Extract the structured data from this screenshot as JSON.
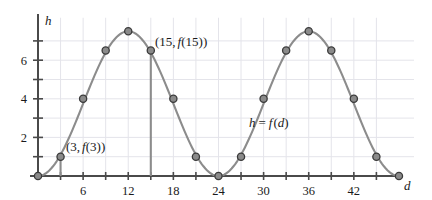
{
  "chart_data": {
    "type": "line",
    "title": "",
    "xlabel": "d",
    "ylabel": "h",
    "grid": true,
    "legend": "none",
    "xlim": [
      0,
      50
    ],
    "ylim": [
      0,
      8.2
    ],
    "x": [
      0,
      3,
      6,
      9,
      12,
      15,
      18,
      21,
      24,
      27,
      30,
      33,
      36,
      39,
      42,
      45,
      48
    ],
    "values": [
      0,
      1,
      4,
      6.5,
      7.5,
      6.5,
      4,
      1,
      0,
      1,
      4,
      6.5,
      7.5,
      6.5,
      4,
      1,
      0
    ],
    "series": [
      {
        "name": "h = f(d)",
        "values": [
          0,
          1,
          4,
          6.5,
          7.5,
          6.5,
          4,
          1,
          0,
          1,
          4,
          6.5,
          7.5,
          6.5,
          4,
          1,
          0
        ]
      }
    ],
    "x_tick_labels": [
      "6",
      "12",
      "18",
      "24",
      "30",
      "36",
      "42"
    ],
    "x_tick_values": [
      6,
      12,
      18,
      24,
      30,
      36,
      42
    ],
    "x_minor_ticks": [
      3,
      9,
      15,
      21,
      27,
      33,
      39,
      45
    ],
    "y_tick_labels": [
      "2",
      "4",
      "6"
    ],
    "y_tick_values": [
      2,
      4,
      6
    ],
    "y_minor_ticks": [
      1,
      3,
      5,
      7
    ],
    "period": 24,
    "amplitude": 3.75,
    "midline": 3.75,
    "curve_color": "#8c8c8c",
    "marker_fill": "#8a8a8a",
    "marker_edge": "#3a3a3a",
    "axis_color": "#4a4a4a",
    "grid_color": "#e4e4ea",
    "text_color": "#1a1a1a",
    "annotations": [
      {
        "id": "point-3",
        "text": "(3, f(3))",
        "at_x": 3,
        "at_y": 1,
        "has_drop_line": true
      },
      {
        "id": "point-15",
        "text": "(15, f(15))",
        "at_x": 15,
        "at_y": 6.5,
        "has_drop_line": true
      },
      {
        "id": "function-label",
        "text": "h = f(d)",
        "at_x": 30,
        "at_y": 2.1,
        "has_drop_line": false
      }
    ]
  },
  "labels": {
    "y_axis_letter": "h",
    "x_axis_letter": "d",
    "x_ticks": [
      "6",
      "12",
      "18",
      "24",
      "30",
      "36",
      "42"
    ],
    "y_ticks": [
      "2",
      "4",
      "6"
    ],
    "annot_point3_open": "(3,",
    "annot_point3_f": "f",
    "annot_point3_close": "(3))",
    "annot_point15_open": "(15,",
    "annot_point15_f": "f",
    "annot_point15_close": "(15))",
    "annot_func_h": "h",
    "annot_func_eq": "=",
    "annot_func_f": "f",
    "annot_func_d_open": "(",
    "annot_func_d": "d",
    "annot_func_d_close": ")"
  }
}
